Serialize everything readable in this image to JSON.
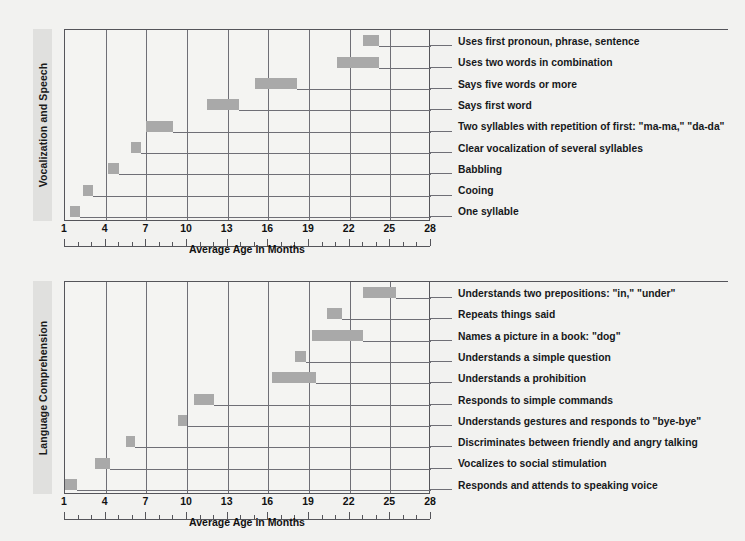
{
  "axis": {
    "title": "Average Age in Months",
    "ticks": [
      1,
      4,
      7,
      10,
      13,
      16,
      19,
      22,
      25,
      28
    ],
    "min": 1,
    "max": 28
  },
  "colors": {
    "bar": "#a9a9a9",
    "grid": "#6f6f76",
    "frame": "#55555a",
    "plot_bg": "#f4f4f2",
    "page_bg": "#f2f2f0",
    "band_bg": "#e0e0de",
    "text": "#16181a"
  },
  "chart_data": [
    {
      "type": "bar",
      "orientation": "horizontal-range",
      "title": "Vocalization and Speech",
      "xlabel": "Average Age in Months",
      "ylabel": "",
      "xlim": [
        1,
        28
      ],
      "grid": true,
      "legend": "none",
      "categories": [
        "Uses first pronoun, phrase, sentence",
        "Uses two words in combination",
        "Says five words or more",
        "Says first word",
        "Two syllables with repetition of first: \"ma-ma,\" \"da-da\"",
        "Clear vocalization of several syllables",
        "Babbling",
        "Cooing",
        "One syllable"
      ],
      "ranges": [
        [
          23.0,
          24.2
        ],
        [
          21.1,
          24.2
        ],
        [
          15.0,
          18.1
        ],
        [
          11.5,
          13.8
        ],
        [
          7.0,
          9.0
        ],
        [
          5.9,
          6.6
        ],
        [
          4.2,
          5.0
        ],
        [
          2.3,
          3.1
        ],
        [
          1.4,
          2.1
        ]
      ]
    },
    {
      "type": "bar",
      "orientation": "horizontal-range",
      "title": "Language Comprehension",
      "xlabel": "Average Age in Months",
      "ylabel": "",
      "xlim": [
        1,
        28
      ],
      "grid": true,
      "legend": "none",
      "categories": [
        "Understands two prepositions: \"in,\" \"under\"",
        "Repeats things said",
        "Names a picture in a book: \"dog\"",
        "Understands a simple question",
        "Understands a prohibition",
        "Responds to simple commands",
        "Understands gestures and responds to \"bye-bye\"",
        "Discriminates between friendly and angry talking",
        "Vocalizes to social stimulation",
        "Responds and attends to speaking voice"
      ],
      "ranges": [
        [
          23.0,
          25.4
        ],
        [
          20.3,
          21.4
        ],
        [
          19.2,
          23.0
        ],
        [
          18.0,
          18.8
        ],
        [
          16.3,
          19.5
        ],
        [
          10.5,
          12.0
        ],
        [
          9.3,
          10.0
        ],
        [
          5.5,
          6.2
        ],
        [
          3.2,
          4.3
        ],
        [
          1.0,
          1.9
        ]
      ]
    }
  ]
}
